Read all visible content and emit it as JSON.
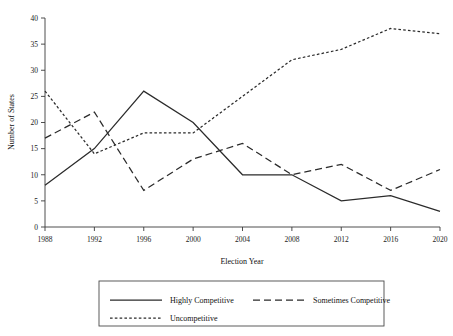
{
  "chart_data": {
    "type": "line",
    "title": "",
    "xlabel": "Election Year",
    "ylabel": "Number of States",
    "categories": [
      "1988",
      "1992",
      "1996",
      "2000",
      "2004",
      "2008",
      "2012",
      "2016",
      "2020"
    ],
    "x": [
      1988,
      1992,
      1996,
      2000,
      2004,
      2008,
      2012,
      2016,
      2020
    ],
    "xlim": [
      1988,
      2020
    ],
    "ylim": [
      0,
      40
    ],
    "yticks": [
      0,
      5,
      10,
      15,
      20,
      25,
      30,
      35,
      40
    ],
    "ytick_labels": [
      "0",
      "5",
      "10",
      "15",
      "20",
      "25",
      "30",
      "35",
      "40"
    ],
    "xticks": [
      1988,
      1992,
      1996,
      2000,
      2004,
      2008,
      2012,
      2016,
      2020
    ],
    "xtick_labels": [
      "1988",
      "1992",
      "1996",
      "2000",
      "2004",
      "2008",
      "2012",
      "2016",
      "2020"
    ],
    "grid": false,
    "legend_position": "bottom",
    "series": [
      {
        "name": "Highly Competitive",
        "style": "solid",
        "color": "#2b2b2b",
        "values": [
          8,
          15,
          26,
          20,
          10,
          10,
          5,
          6,
          3
        ]
      },
      {
        "name": "Sometimes Competitive",
        "style": "dashed",
        "color": "#2b2b2b",
        "values": [
          17,
          22,
          7,
          13,
          16,
          10,
          12,
          7,
          11
        ]
      },
      {
        "name": "Uncompetitive",
        "style": "dotted",
        "color": "#2b2b2b",
        "values": [
          26,
          14,
          18,
          18,
          25,
          32,
          34,
          38,
          37
        ]
      }
    ]
  },
  "legend": {
    "items": [
      {
        "label": "Highly Competitive",
        "style": "solid"
      },
      {
        "label": "Sometimes Competitive",
        "style": "dashed"
      },
      {
        "label": "Uncompetitive",
        "style": "dotted"
      }
    ]
  }
}
